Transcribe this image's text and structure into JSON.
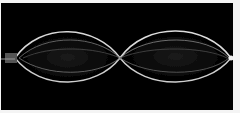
{
  "image": {
    "subject": "standing-wave-on-string",
    "description": "Long-exposure photo of a vibrating string showing two antinode lobes and a central node",
    "background_color": "#000000",
    "border_color": "#f4f4f4",
    "wave_color": "#e6e6e6",
    "lobes": 2,
    "nodes_visible": 3
  }
}
